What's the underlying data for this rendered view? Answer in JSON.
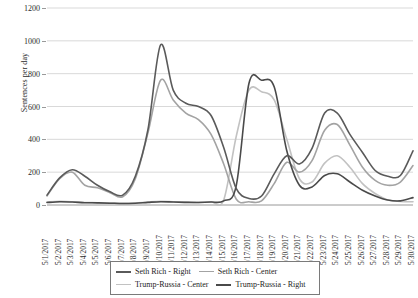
{
  "chart_data": {
    "type": "line",
    "title": "",
    "xlabel": "",
    "ylabel": "Sentences per day",
    "ylim": [
      0,
      1200
    ],
    "ytick_step": 200,
    "yticks": [
      0,
      200,
      400,
      600,
      800,
      1000,
      1200
    ],
    "grid": true,
    "legend_position": "bottom",
    "smoothing": "spline",
    "categories": [
      "5/1/2017",
      "5/2/2017",
      "5/3/2017",
      "5/4/2017",
      "5/5/2017",
      "5/6/2017",
      "5/7/2017",
      "5/8/2017",
      "5/9/2017",
      "5/10/2017",
      "5/11/2017",
      "5/12/2017",
      "5/13/2017",
      "5/14/2017",
      "5/15/2017",
      "5/16/2017",
      "5/17/2017",
      "5/18/2017",
      "5/19/2017",
      "5/20/2017",
      "5/21/2017",
      "5/22/2017",
      "5/23/2017",
      "5/24/2017",
      "5/25/2017",
      "5/26/2017",
      "5/27/2017",
      "5/28/2017",
      "5/29/2017",
      "5/30/2017"
    ],
    "series": [
      {
        "name": "Seth Rich - Right",
        "color": "#5a5a5a",
        "width": 1.6,
        "values": [
          60,
          165,
          215,
          175,
          120,
          80,
          60,
          175,
          460,
          975,
          700,
          620,
          600,
          545,
          350,
          100,
          40,
          55,
          190,
          300,
          250,
          345,
          560,
          560,
          430,
          320,
          210,
          175,
          180,
          330
        ]
      },
      {
        "name": "Seth Rich - Center",
        "color": "#a3a3a3",
        "width": 1.6,
        "values": [
          55,
          160,
          200,
          120,
          105,
          75,
          50,
          160,
          440,
          760,
          640,
          560,
          520,
          430,
          250,
          35,
          20,
          25,
          130,
          260,
          200,
          270,
          455,
          490,
          365,
          230,
          150,
          120,
          140,
          240
        ]
      },
      {
        "name": "Trump-Russia - Center",
        "color": "#c2c2c2",
        "width": 1.6,
        "values": [
          18,
          22,
          20,
          15,
          14,
          12,
          10,
          12,
          18,
          22,
          20,
          18,
          16,
          20,
          30,
          420,
          700,
          690,
          640,
          400,
          160,
          140,
          255,
          300,
          230,
          130,
          70,
          30,
          22,
          20
        ]
      },
      {
        "name": "Trump-Russia - Right",
        "color": "#4a4a4a",
        "width": 1.6,
        "values": [
          15,
          20,
          18,
          14,
          13,
          11,
          9,
          11,
          16,
          20,
          18,
          16,
          15,
          18,
          25,
          120,
          740,
          760,
          720,
          330,
          120,
          110,
          180,
          190,
          140,
          90,
          55,
          30,
          25,
          45
        ]
      }
    ]
  },
  "legend": {
    "items": [
      {
        "label": "Seth Rich - Right",
        "color": "#5a5a5a",
        "width": 2.0
      },
      {
        "label": "Seth Rich - Center",
        "color": "#a3a3a3",
        "width": 1.6
      },
      {
        "label": "Trump-Russia - Center",
        "color": "#c2c2c2",
        "width": 1.6
      },
      {
        "label": "Trump-Russia - Right",
        "color": "#4a4a4a",
        "width": 2.2
      }
    ]
  }
}
